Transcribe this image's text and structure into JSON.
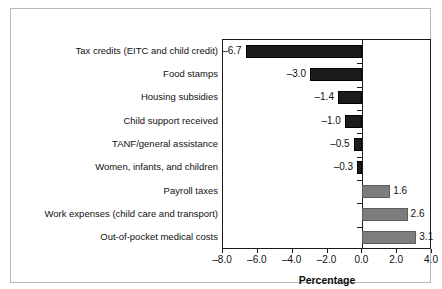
{
  "chart_data": {
    "type": "bar",
    "orientation": "horizontal",
    "title": "",
    "xlabel": "Percentage",
    "ylabel": "",
    "xlim": [
      -8.0,
      4.0
    ],
    "xticks": [
      "–8.0",
      "–6.0",
      "–4.0",
      "–2.0",
      "0.0",
      "2.0",
      "4.0"
    ],
    "xtick_values": [
      -8.0,
      -6.0,
      -4.0,
      -2.0,
      0.0,
      2.0,
      4.0
    ],
    "grid": false,
    "legend": "none",
    "categories": [
      "Tax credits (EITC and child credit)",
      "Food stamps",
      "Housing subsidies",
      "Child support received",
      "TANF/general assistance",
      "Women, infants, and children",
      "Payroll taxes",
      "Work expenses (child care and transport)",
      "Out-of-pocket medical costs"
    ],
    "values": [
      -6.7,
      -3.0,
      -1.4,
      -1.0,
      -0.5,
      -0.3,
      1.6,
      2.6,
      3.1
    ],
    "value_labels": [
      "–6.7",
      "–3.0",
      "–1.4",
      "–1.0",
      "–0.5",
      "–0.3",
      "1.6",
      "2.6",
      "3.1"
    ],
    "colors": {
      "negative_bar": "#1c1c1c",
      "positive_bar": "#7d7d7d",
      "axis": "#1a1a1a",
      "text": "#111111",
      "background": "#ffffff",
      "frame": "#b9b9b9"
    }
  }
}
